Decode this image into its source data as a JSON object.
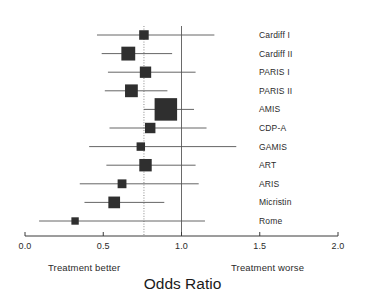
{
  "chart_data": {
    "type": "scatter",
    "subtype": "forest-plot",
    "title": "Odds Ratio",
    "xlabel": "Odds Ratio",
    "ylabel": "",
    "xlim": [
      0.0,
      2.0
    ],
    "xticks": [
      "0.0",
      "0.5",
      "1.0",
      "1.5",
      "2.0"
    ],
    "xtick_values": [
      0.0,
      0.5,
      1.0,
      1.5,
      2.0
    ],
    "grid": false,
    "legend": "none",
    "null_line": 1.0,
    "pooled_line": 0.76,
    "left_annotation": "Treatment better",
    "right_annotation": "Treatment worse",
    "categories": [
      "Cardiff I",
      "Cardiff II",
      "PARIS I",
      "PARIS II",
      "AMIS",
      "CDP-A",
      "GAMIS",
      "ART",
      "ARIS",
      "Micristin",
      "Rome"
    ],
    "points": [
      {
        "label": "Cardiff I",
        "or": 0.76,
        "ci_low": 0.46,
        "ci_high": 1.21,
        "weight": 0.28
      },
      {
        "label": "Cardiff II",
        "or": 0.66,
        "ci_low": 0.49,
        "ci_high": 0.94,
        "weight": 0.52
      },
      {
        "label": "PARIS I",
        "or": 0.77,
        "ci_low": 0.53,
        "ci_high": 1.09,
        "weight": 0.38
      },
      {
        "label": "PARIS II",
        "or": 0.68,
        "ci_low": 0.51,
        "ci_high": 0.91,
        "weight": 0.46
      },
      {
        "label": "AMIS",
        "or": 0.9,
        "ci_low": 0.76,
        "ci_high": 1.08,
        "weight": 1.0
      },
      {
        "label": "CDP-A",
        "or": 0.8,
        "ci_low": 0.54,
        "ci_high": 1.16,
        "weight": 0.33
      },
      {
        "label": "GAMIS",
        "or": 0.74,
        "ci_low": 0.41,
        "ci_high": 1.35,
        "weight": 0.22
      },
      {
        "label": "ART",
        "or": 0.77,
        "ci_low": 0.52,
        "ci_high": 1.09,
        "weight": 0.44
      },
      {
        "label": "ARIS",
        "or": 0.62,
        "ci_low": 0.35,
        "ci_high": 1.11,
        "weight": 0.24
      },
      {
        "label": "Micristin",
        "or": 0.57,
        "ci_low": 0.38,
        "ci_high": 0.89,
        "weight": 0.4
      },
      {
        "label": "Rome",
        "or": 0.32,
        "ci_low": 0.09,
        "ci_high": 1.15,
        "weight": 0.16
      }
    ]
  },
  "axis": {
    "ticks": [
      {
        "label": "0.0",
        "value": 0.0
      },
      {
        "label": "0.5",
        "value": 0.5
      },
      {
        "label": "1.0",
        "value": 1.0
      },
      {
        "label": "1.5",
        "value": 1.5
      },
      {
        "label": "2.0",
        "value": 2.0
      }
    ]
  },
  "footer": {
    "left": "Treatment better",
    "right": "Treatment worse"
  },
  "title": "Odds Ratio",
  "colors": {
    "marker": "#2f2f2f",
    "line": "#555555",
    "axis": "#3a3a3a",
    "null_line": "#6a6a6a",
    "pooled_line": "#8a8a8a",
    "text": "#2b2b2b",
    "background": "#ffffff"
  }
}
